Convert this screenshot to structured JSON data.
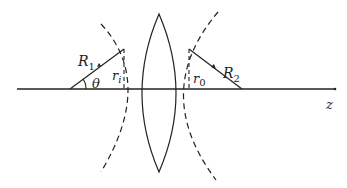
{
  "diagram": {
    "colors": {
      "stroke": "#222222",
      "background": "#ffffff"
    },
    "labels": {
      "R1": "R",
      "R1_sub": "1",
      "R2": "R",
      "R2_sub": "2",
      "theta": "θ",
      "ri": "r",
      "ri_sub": "i",
      "r0": "r",
      "r0_sub": "0",
      "z": "z"
    },
    "elements": [
      {
        "id": "optical-axis",
        "type": "line",
        "from": [
          17,
          89
        ],
        "to": [
          335,
          89
        ],
        "style": "solid"
      },
      {
        "id": "lens",
        "type": "biconvex-lens",
        "top": [
          159,
          14
        ],
        "bottom": [
          159,
          172
        ],
        "left_x": 142,
        "right_x": 175
      },
      {
        "id": "surface-1-arc",
        "type": "arc",
        "style": "dashed"
      },
      {
        "id": "surface-2-arc",
        "type": "arc",
        "style": "dashed"
      },
      {
        "id": "radius-R1",
        "type": "line",
        "from": [
          70,
          89
        ],
        "to": [
          124,
          49
        ],
        "arrow": "mid"
      },
      {
        "id": "radius-R2",
        "type": "line",
        "from": [
          189,
          49
        ],
        "to": [
          242,
          89
        ],
        "arrow": "mid"
      },
      {
        "id": "height-ri",
        "type": "line",
        "from": [
          124,
          49
        ],
        "to": [
          124,
          89
        ],
        "style": "dashed"
      },
      {
        "id": "height-r0",
        "type": "line",
        "from": [
          189,
          49
        ],
        "to": [
          189,
          89
        ],
        "style": "dashed"
      }
    ]
  }
}
